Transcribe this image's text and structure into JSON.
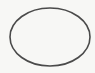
{
  "canvas": {
    "width": 95,
    "height": 73,
    "background": "#f7f7f5"
  },
  "shape": {
    "type": "ellipse",
    "cx": 50,
    "cy": 37,
    "rx": 40,
    "ry": 29,
    "stroke": "#4a4a4a",
    "stroke_width": 1.6,
    "fill": "none"
  }
}
